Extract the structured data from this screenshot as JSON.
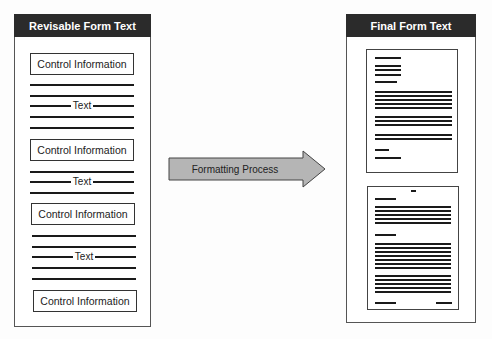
{
  "left_panel": {
    "title": "Revisable Form Text",
    "blocks": [
      {
        "type": "control",
        "label": "Control Information"
      },
      {
        "type": "text",
        "label": "Text"
      },
      {
        "type": "control",
        "label": "Control Information"
      },
      {
        "type": "text",
        "label": "Text"
      },
      {
        "type": "control",
        "label": "Control Information"
      },
      {
        "type": "text",
        "label": "Text"
      },
      {
        "type": "control",
        "label": "Control Information"
      }
    ]
  },
  "arrow": {
    "label": "Formatting Process",
    "fill": "#b5b5b5"
  },
  "right_panel": {
    "title": "Final Form Text",
    "pages": 2
  },
  "colors": {
    "header_bg": "#2b2b2b",
    "header_text": "#ffffff",
    "line": "#1a1a1a"
  }
}
